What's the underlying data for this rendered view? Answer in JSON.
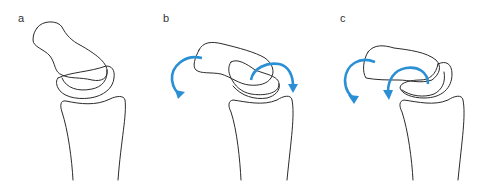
{
  "figure": {
    "panels": [
      {
        "label": "a",
        "arrows": 0,
        "description": "neutral alignment of carpal bones over radius"
      },
      {
        "label": "b",
        "arrows": 2,
        "description": "rotation of proximal and distal carpal rows, clockwise arrows"
      },
      {
        "label": "c",
        "arrows": 2,
        "description": "rotation of carpal rows, counter-clockwise arrows"
      }
    ],
    "colors": {
      "outline": "#2b2b2b",
      "arrow": "#2a8fd4",
      "background": "#ffffff"
    }
  }
}
